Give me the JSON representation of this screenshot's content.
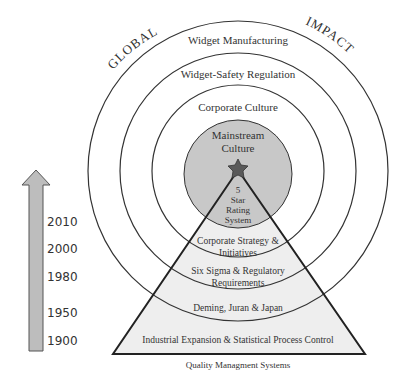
{
  "diagram": {
    "arc_labels": {
      "left": "GLOBAL",
      "right": "IMPACT"
    },
    "rings": [
      {
        "label": "Widget Manufacturing"
      },
      {
        "label": "Widget-Safety Regulation"
      },
      {
        "label": "Corporate Culture"
      }
    ],
    "core": {
      "label_line1": "Mainstream",
      "label_line2": "Culture",
      "fill": "#c8c8c8"
    },
    "star": {
      "label_line1": "5",
      "label_line2": "Star",
      "label_line3": "Rating",
      "label_line4": "System",
      "fill": "#5a5a5a"
    },
    "pyramid": {
      "fill": "#eeeeee",
      "layers": [
        {
          "line1": "Corporate Strategy &",
          "line2": "Initiatives"
        },
        {
          "line1": "Six Sigma & Regulatory",
          "line2": "Requirements"
        },
        {
          "line1": "Deming, Juran & Japan"
        },
        {
          "line1": "Industrial Expansion & Statistical Process Control"
        }
      ],
      "caption": "Quality Managment Systems"
    },
    "timeline": {
      "arrow_fill": "#bdbdbd",
      "years": [
        "2010",
        "2000",
        "1980",
        "1950",
        "1900"
      ]
    }
  }
}
